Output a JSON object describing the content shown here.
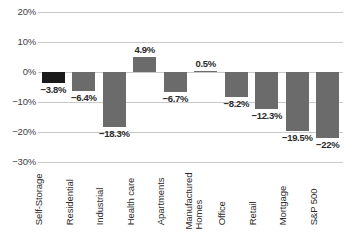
{
  "chart_data": {
    "type": "bar",
    "title": "",
    "xlabel": "",
    "ylabel": "",
    "ylim": [
      -30,
      20
    ],
    "ytick_step": 10,
    "grid": true,
    "legend": "none",
    "categories": [
      "Self-Storage",
      "Residential",
      "Industrial",
      "Health care",
      "Apartments",
      "Manufactured\nHomes",
      "Office",
      "Retail",
      "Mortgage",
      "S&P 500"
    ],
    "values": [
      -3.8,
      -6.4,
      -18.3,
      4.9,
      -6.7,
      0.5,
      -8.2,
      -12.3,
      -19.5,
      -22.0
    ],
    "data_labels": [
      "−3.8%",
      "−6.4%",
      "−18.3%",
      "4.9%",
      "−6.7%",
      "0.5%",
      "−8.2%",
      "−12.3%",
      "−19.5%",
      "−22%"
    ],
    "ytick_labels": [
      "20%",
      "10%",
      "0%",
      "−10%",
      "−20%",
      "−30%"
    ],
    "ytick_values": [
      20,
      10,
      0,
      -10,
      -20,
      -30
    ],
    "highlight_index": 0,
    "colors": {
      "bar": "#6b6b6b",
      "bar_highlight": "#1a1a1a",
      "gridline": "#c9c9c9",
      "text": "#2b2b2b",
      "axis_text": "#3f3f3f",
      "background": "#ffffff"
    }
  }
}
